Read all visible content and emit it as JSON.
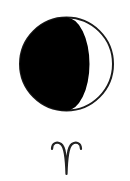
{
  "moon": {
    "phase_icon": "waxing-gibbous-moon-icon",
    "phase_label": "Moon phase",
    "colors": {
      "shadow": "#000000",
      "lit": "#ffffff",
      "outline": "#1a1a1a"
    }
  },
  "zodiac": {
    "sign_icon": "aries-icon",
    "symbol": "♈",
    "colors": {
      "stroke": "#222222"
    }
  }
}
